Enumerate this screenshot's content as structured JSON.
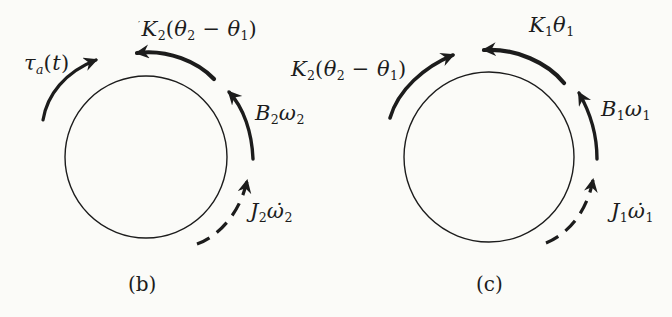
{
  "figure": {
    "type": "torque-balance-free-body-diagram",
    "background_color": "#fbfbf8",
    "ink_color": "#1c1c1c",
    "diagrams": [
      {
        "id": "b",
        "caption": "(b)",
        "labels": {
          "applied_torque": [
            "i:τ",
            "si:a",
            "n:(",
            "i:t",
            "n:)"
          ],
          "spring_torque": [
            "t:′",
            "i:K",
            "s:2",
            "n:(",
            "i:θ",
            "s:2",
            "n: − ",
            "i:θ",
            "s:1",
            "n:)"
          ],
          "damper_torque": [
            "i:B",
            "s:2",
            "i:ω",
            "s:2"
          ],
          "inertia_torque": [
            "i:J",
            "s:2",
            "i:ω̇",
            "s:2"
          ]
        }
      },
      {
        "id": "c",
        "caption": "(c)",
        "labels": {
          "spring_torque_k2": [
            "i:K",
            "s:2",
            "n:(",
            "i:θ",
            "s:2",
            "n: − ",
            "i:θ",
            "s:1",
            "n:)"
          ],
          "spring_torque_k1": [
            "i:K",
            "s:1",
            "i:θ",
            "s:1"
          ],
          "damper_torque": [
            "i:B",
            "s:1",
            "i:ω",
            "s:1"
          ],
          "inertia_torque": [
            "i:J",
            "s:1",
            "i:ω̇",
            "s:1"
          ]
        }
      }
    ]
  }
}
